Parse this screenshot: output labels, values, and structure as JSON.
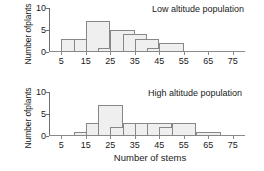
{
  "chart_data": [
    {
      "type": "bar",
      "title": "Low altitude population",
      "xlabel": "",
      "ylabel": "Number of plants",
      "ylabel_line1": "Number of",
      "ylabel_line2": "plants",
      "bin_width": 10,
      "bin_starts": [
        5,
        10,
        15,
        20,
        25,
        30,
        35,
        40,
        45,
        50,
        55,
        60,
        65,
        70,
        75
      ],
      "values": [
        3,
        3,
        7,
        1,
        5,
        4,
        3,
        1,
        2,
        0,
        0,
        0,
        0,
        0,
        0
      ],
      "xticks": [
        5,
        15,
        25,
        35,
        45,
        55,
        65,
        75
      ],
      "yticks": [
        0,
        5,
        10
      ],
      "xlim": [
        0,
        80
      ],
      "ylim": [
        0,
        10
      ],
      "grid": false,
      "legend": "none",
      "bar_fill": "#efefef",
      "bar_stroke": "#878787"
    },
    {
      "type": "bar",
      "title": "High altitude population",
      "xlabel": "Number of stems",
      "ylabel": "Number of plants",
      "ylabel_line1": "Number of",
      "ylabel_line2": "plants",
      "bin_width": 10,
      "bin_starts": [
        5,
        10,
        15,
        20,
        25,
        30,
        35,
        40,
        45,
        50,
        55,
        60,
        65,
        70,
        75
      ],
      "values": [
        0,
        1,
        3,
        7,
        2,
        3,
        3,
        3,
        2,
        3,
        0,
        1,
        0,
        0,
        0
      ],
      "xticks": [
        5,
        15,
        25,
        35,
        45,
        55,
        65,
        75
      ],
      "yticks": [
        0,
        5,
        10
      ],
      "xlim": [
        0,
        80
      ],
      "ylim": [
        0,
        10
      ],
      "grid": false,
      "legend": "none",
      "bar_fill": "#efefef",
      "bar_stroke": "#878787"
    }
  ],
  "figure": {
    "shared_xlabel": "Number of stems",
    "background": "#ffffff",
    "axis_color": "#8a8a8a"
  }
}
